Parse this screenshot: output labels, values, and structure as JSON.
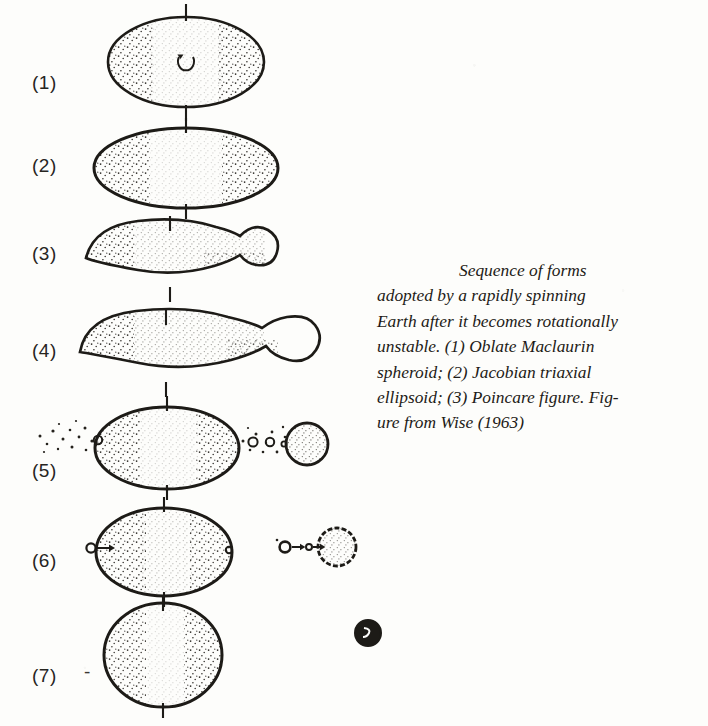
{
  "figure": {
    "title": "Sequence of forms adopted by a rapidly spinning Earth after it becomes rotationally unstable",
    "background_color": "#fdfdfb",
    "ink_color": "#1d1b17"
  },
  "caption": {
    "lines": [
      "Sequence of forms",
      "adopted by a rapidly spinning",
      "Earth after it becomes rotationally",
      "unstable. (1) Oblate Maclaurin",
      "spheroid; (2) Jacobian triaxial",
      "ellipsoid; (3) Poincare figure. Fig-",
      "ure from Wise (1963)"
    ]
  },
  "rows": [
    {
      "label": "(1)",
      "name": "oblate-maclaurin-spheroid",
      "description": "Oblate Maclaurin spheroid with vertical rotation axis and central spin arrow"
    },
    {
      "label": "(2)",
      "name": "jacobian-triaxial-ellipsoid",
      "description": "Jacobian triaxial ellipsoid, wider and flatter"
    },
    {
      "label": "(3)",
      "name": "poincare-figure",
      "description": "Poincare pear-shaped figure with bulge forming on the right"
    },
    {
      "label": "(4)",
      "name": "necked-poincare-figure",
      "description": "Further elongated figure with narrow neck and detaching lobe"
    },
    {
      "label": "(5)",
      "name": "fission-with-debris",
      "description": "Ellipsoid fissioned, debris trail and separated body to the right"
    },
    {
      "label": "(6)",
      "name": "accretion-stage",
      "description": "Ellipsoid and companion body accreting infalling particles"
    },
    {
      "label": "(7)",
      "name": "earth-and-moon",
      "description": "Near spherical Earth with small dark Moon at right",
      "dash": "-"
    }
  ]
}
